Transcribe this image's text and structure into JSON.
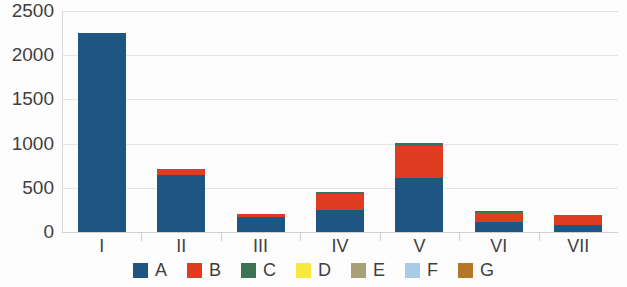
{
  "chart_data": {
    "type": "bar",
    "subtype": "stacked-bar",
    "title": "",
    "subtitle": "",
    "xlabel": "",
    "ylabel": "",
    "categories": [
      "I",
      "II",
      "III",
      "IV",
      "V",
      "VI",
      "VII"
    ],
    "series": [
      {
        "name": "A",
        "color": "#1f5582",
        "values": [
          2250,
          640,
          175,
          250,
          610,
          110,
          85
        ]
      },
      {
        "name": "B",
        "color": "#df3c21",
        "values": [
          0,
          75,
          30,
          180,
          360,
          110,
          110
        ]
      },
      {
        "name": "C",
        "color": "#3c7355",
        "values": [
          0,
          0,
          0,
          20,
          40,
          15,
          0
        ]
      },
      {
        "name": "D",
        "color": "#f7e93f",
        "values": [
          0,
          0,
          0,
          0,
          0,
          0,
          0
        ]
      },
      {
        "name": "E",
        "color": "#a8a077",
        "values": [
          0,
          0,
          0,
          0,
          0,
          0,
          0
        ]
      },
      {
        "name": "F",
        "color": "#a8cbe6",
        "values": [
          0,
          0,
          0,
          0,
          0,
          0,
          0
        ]
      },
      {
        "name": "G",
        "color": "#b5762a",
        "values": [
          0,
          0,
          0,
          0,
          0,
          0,
          0
        ]
      }
    ],
    "totals": [
      2250,
      715,
      205,
      450,
      1010,
      235,
      195
    ],
    "ylim": [
      0,
      2500
    ],
    "ytick_values": [
      0,
      500,
      1000,
      1500,
      2000,
      2500
    ],
    "ytick_labels": [
      "0",
      "500",
      "1000",
      "1500",
      "2000",
      "2500"
    ],
    "grid": true,
    "grid_axis": "y",
    "legend_position": "bottom",
    "legend_entries": [
      "A",
      "B",
      "C",
      "D",
      "E",
      "F",
      "G"
    ],
    "annotations": []
  },
  "axis": {
    "y_labels": [
      "2500",
      "2000",
      "1500",
      "1000",
      "500",
      "0"
    ]
  },
  "legend": {
    "items": [
      {
        "label": "A"
      },
      {
        "label": "B"
      },
      {
        "label": "C"
      },
      {
        "label": "D"
      },
      {
        "label": "E"
      },
      {
        "label": "F"
      },
      {
        "label": "G"
      }
    ]
  }
}
